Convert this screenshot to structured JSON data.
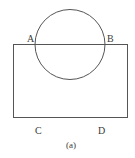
{
  "diagram": {
    "caption": "(a)",
    "stroke_color": "#555555",
    "points": {
      "A": "A",
      "B": "B",
      "C": "C",
      "D": "D"
    },
    "shapes": {
      "rectangle": {
        "x": 13,
        "y": 44,
        "width": 114,
        "height": 73
      },
      "circle": {
        "cx": 70,
        "cy": 44,
        "r": 35
      }
    }
  }
}
